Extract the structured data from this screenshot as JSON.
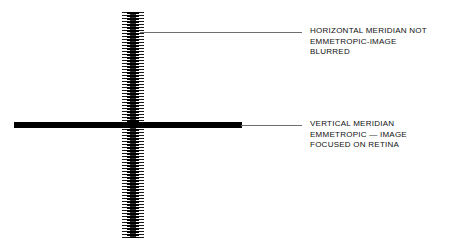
{
  "figure": {
    "background_color": "#ffffff",
    "ink_color": "#000000",
    "leader_color": "#6e6e6e"
  },
  "elements": {
    "vertical_meridian": {
      "name": "vertical-meridian-blurred",
      "rendering": "dense horizontal striping indicating a blurred image",
      "orientation": "vertical"
    },
    "horizontal_meridian": {
      "name": "horizontal-meridian-sharp",
      "rendering": "solid black bar indicating a sharply focused image",
      "orientation": "horizontal"
    }
  },
  "callouts": [
    {
      "id": "callout-horizontal-meridian",
      "lines": [
        "HORIZONTAL MERIDIAN NOT",
        "EMMETROPIC-IMAGE",
        "BLURRED"
      ]
    },
    {
      "id": "callout-vertical-meridian",
      "lines": [
        "VERTICAL MERIDIAN",
        "EMMETROPIC — IMAGE",
        "FOCUSED ON RETINA"
      ]
    }
  ]
}
